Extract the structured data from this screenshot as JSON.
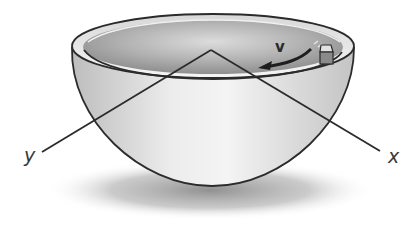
{
  "diagram": {
    "labels": {
      "velocity": "v",
      "axis_y": "y",
      "axis_x": "x"
    },
    "colors": {
      "outline": "#2b2b2b",
      "bowl_light": "#f2f2f2",
      "bowl_mid": "#cfcfcf",
      "bowl_dark": "#9a9a9a",
      "interior": "#a9a9a9",
      "shadow": "#8c8c8c",
      "block_top": "#e6e6e6",
      "block_side": "#8a8a8a"
    }
  }
}
